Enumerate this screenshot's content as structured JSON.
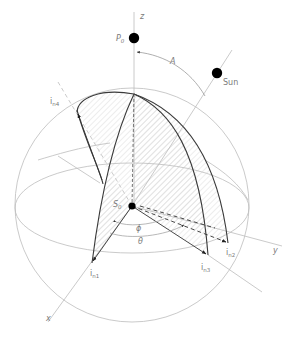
{
  "diagram": {
    "type": "celestial-sphere-geometry",
    "labels": {
      "z_axis": "z",
      "x_axis": "x",
      "y_axis": "y",
      "pole": "P",
      "pole_sub": "0",
      "sun": "Sun",
      "zenith_angle": "A",
      "observer": "S",
      "observer_sub": "0",
      "azimuth_phi": "ϕ",
      "angle_theta": "θ",
      "normal_1": "i",
      "normal_1_sub": "n1",
      "normal_2": "i",
      "normal_2_sub": "n2",
      "normal_3": "i",
      "normal_3_sub": "n3",
      "normal_4": "i",
      "normal_4_sub": "n4"
    },
    "points": {
      "sphere_center": [
        132,
        205
      ],
      "sphere_radius": 117,
      "S0": [
        132,
        206
      ],
      "P0": [
        134,
        38
      ],
      "Sun": [
        217,
        73
      ],
      "in1": [
        92,
        263
      ],
      "in2": [
        228,
        243
      ],
      "in3": [
        208,
        255
      ],
      "in4": [
        77,
        110
      ],
      "arc_top": [
        134,
        94
      ]
    },
    "colors": {
      "thin_line": "#b8b8b8",
      "bold_line": "#3a3a3a",
      "hatch": "#d6d6d6",
      "dot": "#000000",
      "label": "#7a7a7a"
    }
  }
}
